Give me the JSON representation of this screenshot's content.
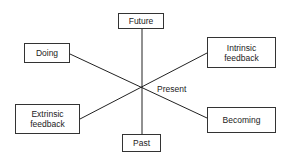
{
  "diagram": {
    "center_label": "Present",
    "nodes": [
      {
        "id": "future",
        "label": "Future"
      },
      {
        "id": "past",
        "label": "Past"
      },
      {
        "id": "doing",
        "label": "Doing"
      },
      {
        "id": "becoming",
        "label": "Becoming"
      },
      {
        "id": "intrinsic",
        "label": "Intrinsic feedback"
      },
      {
        "id": "extrinsic",
        "label": "Extrinsic feedback"
      }
    ],
    "axes": [
      {
        "from": "future",
        "to": "past"
      },
      {
        "from": "doing",
        "to": "becoming"
      },
      {
        "from": "extrinsic",
        "to": "intrinsic"
      }
    ]
  }
}
